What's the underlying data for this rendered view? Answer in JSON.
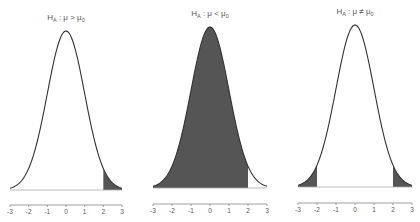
{
  "chart_data": [
    {
      "type": "area",
      "title": "H_A : μ > μ0",
      "title_parts": {
        "h": "H",
        "sub": "A",
        "rel": " : μ > μ",
        "sub2": "0"
      },
      "distribution": "standard normal",
      "x_ticks": [
        -3,
        -2,
        -1,
        0,
        1,
        2,
        3
      ],
      "xlim": [
        -3,
        3
      ],
      "shaded_regions": [
        [
          2,
          3
        ]
      ],
      "tail": "upper",
      "shade_color": "#555555",
      "layout": {
        "x0": 10,
        "x1": 122,
        "peak_y": 31,
        "base_y": 190,
        "axis_y": 205
      }
    },
    {
      "type": "area",
      "title": "H_A : μ < μ0",
      "title_parts": {
        "h": "H",
        "sub": "A",
        "rel": " : μ < μ",
        "sub2": "0"
      },
      "distribution": "standard normal",
      "x_ticks": [
        -3,
        -2,
        -1,
        0,
        1,
        2,
        3
      ],
      "xlim": [
        -3,
        3
      ],
      "shaded_regions": [
        [
          -3,
          2
        ]
      ],
      "tail": "lower",
      "shade_color": "#555555",
      "layout": {
        "x0": 153,
        "x1": 267,
        "peak_y": 27,
        "base_y": 188,
        "axis_y": 204
      }
    },
    {
      "type": "area",
      "title": "H_A : μ ≠ μ0",
      "title_parts": {
        "h": "H",
        "sub": "A",
        "rel": " : μ ≠ μ",
        "sub2": "0"
      },
      "distribution": "standard normal",
      "x_ticks": [
        -3,
        -2,
        -1,
        0,
        1,
        2,
        3
      ],
      "xlim": [
        -3,
        3
      ],
      "shaded_regions": [
        [
          -3,
          -2
        ],
        [
          2,
          3
        ]
      ],
      "tail": "two-sided",
      "shade_color": "#555555",
      "layout": {
        "x0": 298,
        "x1": 412,
        "peak_y": 25,
        "base_y": 187,
        "axis_y": 203
      }
    }
  ]
}
